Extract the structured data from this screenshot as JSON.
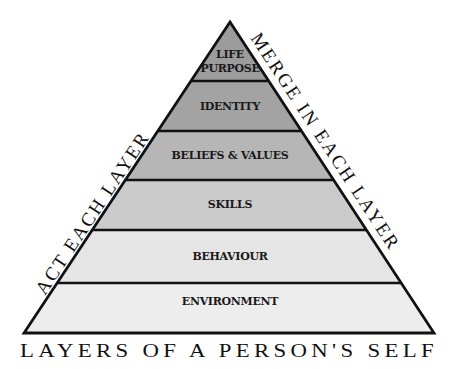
{
  "diagram": {
    "title": "LAYERS OF A PERSON'S SELF",
    "left_side_label": "ACT EACH LAYER",
    "right_side_label": "MERGE IN EACH LAYER",
    "layers": [
      {
        "lines": [
          "LIFE",
          "PURPOSE"
        ],
        "fill": "#9c9c9c"
      },
      {
        "lines": [
          "IDENTITY"
        ],
        "fill": "#a3a3a3"
      },
      {
        "lines": [
          "BELIEFS & VALUES"
        ],
        "fill": "#b6b6b6"
      },
      {
        "lines": [
          "SKILLS"
        ],
        "fill": "#cbcbcb"
      },
      {
        "lines": [
          "BEHAVIOUR"
        ],
        "fill": "#e5e5e5"
      },
      {
        "lines": [
          "ENVIRONMENT"
        ],
        "fill": "#ededed"
      }
    ],
    "colors": {
      "outline": "#111111",
      "background": "#ffffff"
    }
  }
}
